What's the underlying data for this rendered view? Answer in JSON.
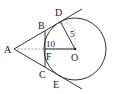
{
  "diagram": {
    "type": "geometry-tangent-circle",
    "points": {
      "A": {
        "label": "A",
        "x": 14,
        "y": 49
      },
      "B": {
        "label": "B",
        "x": 45,
        "y": 31
      },
      "C": {
        "label": "C",
        "x": 45,
        "y": 67
      },
      "D": {
        "label": "D",
        "x": 60,
        "y": 21
      },
      "E": {
        "label": "E",
        "x": 60,
        "y": 77
      },
      "F": {
        "label": "F",
        "x": 45,
        "y": 49
      },
      "O": {
        "label": "O",
        "x": 75,
        "y": 49
      }
    },
    "circle": {
      "cx": 75,
      "cy": 49,
      "r": 31
    },
    "annotations": {
      "radius_label": "5",
      "distance_label": "10"
    },
    "colors": {
      "stroke": "#333333",
      "dashed": "#888888",
      "background": "#ffffff"
    }
  }
}
